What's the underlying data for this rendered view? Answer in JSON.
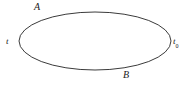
{
  "figure": {
    "type": "closed-contour-ellipse",
    "background_color": "#ffffff",
    "curve_color": "#3b3b3b",
    "curve_width": 1,
    "ellipse": {
      "center_x": 95,
      "center_y": 41,
      "radius_x": 76,
      "radius_y": 29
    },
    "labels": {
      "upper_arc": "A",
      "lower_arc": "B",
      "start_point": "t",
      "end_point": "t",
      "end_point_subscript": "0"
    }
  }
}
